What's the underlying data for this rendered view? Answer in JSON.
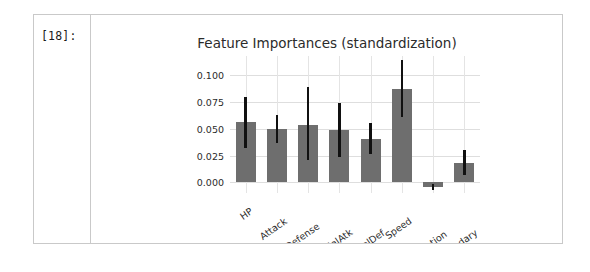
{
  "cell": {
    "prompt_label": "[18]:"
  },
  "chart_data": {
    "type": "bar",
    "title": "Feature Importances (standardization)",
    "xlabel": "",
    "ylabel": "",
    "categories": [
      "HP",
      "Attack",
      "Defense",
      "SpecialAtk",
      "SpecialDef",
      "Speed",
      "Generation",
      "Legendary"
    ],
    "values": [
      0.056,
      0.05,
      0.054,
      0.049,
      0.04,
      0.087,
      -0.004,
      0.018
    ],
    "error_low": [
      0.032,
      0.037,
      0.021,
      0.024,
      0.026,
      0.061,
      -0.007,
      0.007
    ],
    "error_high": [
      0.08,
      0.063,
      0.089,
      0.074,
      0.055,
      0.114,
      -0.002,
      0.03
    ],
    "ylim": [
      -0.01,
      0.118
    ],
    "yticks": [
      0.0,
      0.025,
      0.05,
      0.075,
      0.1
    ],
    "ytick_labels": [
      "0.000",
      "0.025",
      "0.050",
      "0.075",
      "0.100"
    ],
    "grid": true,
    "legend": null,
    "bar_color": "#6e6e6e",
    "error_color": "#111111",
    "grid_color": "#dedede",
    "background_color": "#ffffff"
  }
}
